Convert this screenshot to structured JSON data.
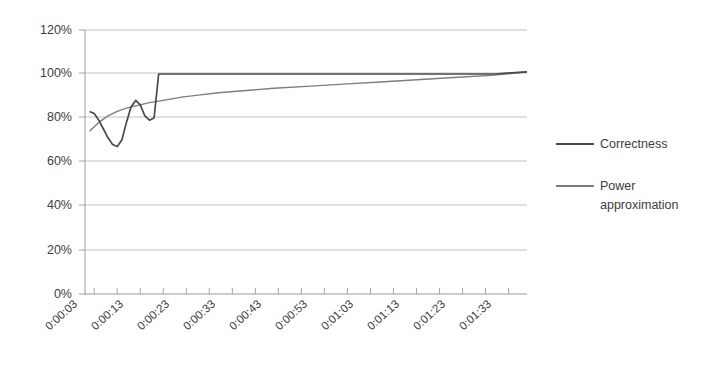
{
  "chart_data": {
    "type": "line",
    "title": "",
    "subtitle": "",
    "xlabel": "",
    "ylabel": "",
    "grid": true,
    "legend_position": "right",
    "ylim": [
      0,
      120
    ],
    "y_unit": "%",
    "y_ticks": [
      "0%",
      "20%",
      "40%",
      "60%",
      "80%",
      "100%",
      "120%"
    ],
    "y_tick_values": [
      0,
      20,
      40,
      60,
      80,
      100,
      120
    ],
    "x_tick_labels": [
      "0:00:03",
      "0:00:13",
      "0:00:23",
      "0:00:33",
      "0:00:43",
      "0:00:53",
      "0:01:03",
      "0:01:13",
      "0:01:23",
      "0:01:33"
    ],
    "x_tick_seconds": [
      3,
      13,
      23,
      33,
      43,
      53,
      63,
      73,
      83,
      93
    ],
    "x_minor_tick_interval_seconds": 5,
    "xlim_seconds": [
      1,
      97
    ],
    "series": [
      {
        "name": "Correctness",
        "color": "#4a4a4a",
        "x_seconds": [
          2,
          3,
          4,
          5,
          6,
          7,
          8,
          9,
          10,
          11,
          12,
          13,
          14,
          15,
          16,
          17,
          18,
          19,
          20,
          30,
          40,
          50,
          60,
          70,
          80,
          90,
          97
        ],
        "values": [
          83,
          82,
          79,
          75,
          71,
          68,
          67,
          70,
          78,
          85,
          88,
          86,
          81,
          79,
          80,
          100,
          100,
          100,
          100,
          100,
          100,
          100,
          100,
          100,
          100,
          100,
          101
        ]
      },
      {
        "name": "Power approximation",
        "color": "#7d7d7d",
        "x_seconds": [
          2,
          3,
          4,
          5,
          6,
          8,
          10,
          12,
          15,
          18,
          22,
          26,
          30,
          36,
          42,
          50,
          58,
          66,
          74,
          82,
          90,
          97
        ],
        "values": [
          74,
          76,
          78,
          79.5,
          81,
          83,
          84.5,
          85.5,
          87,
          88,
          89.5,
          90.5,
          91.5,
          92.5,
          93.5,
          94.5,
          95.5,
          96.5,
          97.5,
          98.5,
          99.5,
          101
        ]
      }
    ],
    "legend_entries": [
      {
        "label": "Correctness",
        "color": "#4a4a4a"
      },
      {
        "label": "Power approximation",
        "color": "#7d7d7d"
      }
    ],
    "colors": {
      "correctness": "#4a4a4a",
      "power_approximation": "#7d7d7d",
      "gridline": "#b9b9b9",
      "axis": "#9a9a9a",
      "text": "#3d3d3d",
      "background": "#ffffff"
    }
  },
  "legend": {
    "items": [
      {
        "label": "Correctness"
      },
      {
        "label": "Power",
        "label_line2": "approximation"
      }
    ]
  }
}
